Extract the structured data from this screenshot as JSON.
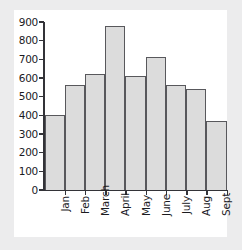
{
  "chart_data": {
    "type": "bar",
    "title": "",
    "xlabel": "",
    "ylabel": "",
    "categories": [
      "Jan",
      "Feb",
      "March",
      "April",
      "May",
      "June",
      "July",
      "Aug",
      "Sept"
    ],
    "values": [
      400,
      560,
      620,
      880,
      610,
      715,
      565,
      540,
      370
    ],
    "ylim": [
      0,
      900
    ],
    "ytick_labels": [
      "900",
      "800",
      "700",
      "600",
      "500",
      "400",
      "300",
      "200",
      "100",
      "0"
    ],
    "ytick_values": [
      900,
      800,
      700,
      600,
      500,
      400,
      300,
      200,
      100,
      0
    ],
    "ytick_step": 100,
    "grid": false,
    "legend": null,
    "bar_fill_color": "#dcdcdc",
    "bar_border_color": "#58585c",
    "axis_color": "#333338",
    "plot_background": "#ffffff",
    "page_background": "#ececed",
    "xtick_label_rotation": 90
  }
}
